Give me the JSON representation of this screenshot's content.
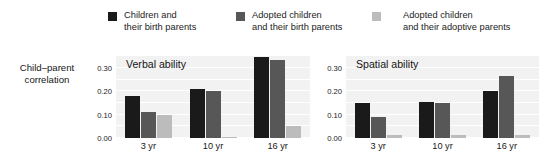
{
  "chart_data": {
    "type": "bar",
    "ylabel": "Child–parent\ncorrelation",
    "xlabel": "",
    "ylim": [
      0.0,
      0.355
    ],
    "yticks": [
      0.0,
      0.1,
      0.2,
      0.3
    ],
    "ytick_labels": [
      "0.00",
      "0.10",
      "0.20",
      "0.30"
    ],
    "grid": true,
    "legend_position": "top",
    "categories": [
      "3 yr",
      "10 yr",
      "16 yr"
    ],
    "panels": [
      {
        "title": "Verbal ability",
        "categories": [
          "3 yr",
          "10 yr",
          "16 yr"
        ],
        "series": [
          {
            "name": "Children and their birth parents",
            "color": "#1a1a1a",
            "values": [
              0.18,
              0.21,
              0.345
            ]
          },
          {
            "name": "Adopted children and their birth parents",
            "color": "#575757",
            "values": [
              0.11,
              0.2,
              0.335
            ]
          },
          {
            "name": "Adopted children and their adoptive parents",
            "color": "#bcbcbc",
            "values": [
              0.1,
              0.005,
              0.05
            ]
          }
        ]
      },
      {
        "title": "Spatial ability",
        "categories": [
          "3 yr",
          "10 yr",
          "16 yr"
        ],
        "series": [
          {
            "name": "Children and their birth parents",
            "color": "#1a1a1a",
            "values": [
              0.15,
              0.155,
              0.2
            ]
          },
          {
            "name": "Adopted children and their birth parents",
            "color": "#575757",
            "values": [
              0.09,
              0.15,
              0.265
            ]
          },
          {
            "name": "Adopted children and their adoptive parents",
            "color": "#bcbcbc",
            "values": [
              0.015,
              0.015,
              0.015
            ]
          }
        ]
      }
    ]
  },
  "legend": {
    "entries": [
      {
        "label": "Children and\ntheir birth parents",
        "color": "#1a1a1a"
      },
      {
        "label": "Adopted children\nand their birth parents",
        "color": "#575757"
      },
      {
        "label": "Adopted children\nand their adoptive parents",
        "color": "#bcbcbc"
      }
    ]
  },
  "axis": {
    "y_title": "Child–parent\ncorrelation"
  },
  "colors": {
    "plot_background": "#f2f2f2",
    "gridline": "#ffffff",
    "page_background": "#ffffff",
    "text": "#1a1a1a"
  }
}
